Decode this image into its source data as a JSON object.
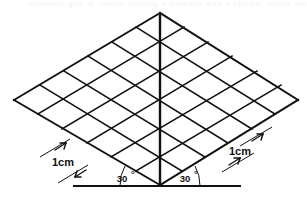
{
  "figure": {
    "name": "isometric-rhombus-grid",
    "description": "Isometric grid of rhombi forming a diamond with a vertical centre axis and a horizontal base line",
    "grid": {
      "cells_per_side": 6,
      "cell_label": "1cm",
      "apex": {
        "x": 160,
        "y": 13
      },
      "left_vertex": {
        "x": 14,
        "y": 100
      },
      "right_vertex": {
        "x": 298,
        "y": 100
      },
      "bottom_vertex": {
        "x": 160,
        "y": 185
      }
    },
    "axis": {
      "label": "centre-axis",
      "from": {
        "x": 160,
        "y": 13
      },
      "to": {
        "x": 160,
        "y": 185
      }
    },
    "baseline": {
      "label": "ground-line",
      "from": {
        "x": 73,
        "y": 186
      },
      "to": {
        "x": 241,
        "y": 186
      }
    },
    "angles": [
      {
        "id": "angle-left",
        "value": "30",
        "degree_symbol": "°",
        "x": 128,
        "y": 180
      },
      {
        "id": "angle-right",
        "value": "30",
        "degree_symbol": "°",
        "x": 183,
        "y": 180
      }
    ],
    "dimensions": [
      {
        "id": "dim-left",
        "text": "1cm",
        "x": 52,
        "y": 164
      },
      {
        "id": "dim-right",
        "text": "1cm",
        "x": 229,
        "y": 152
      }
    ],
    "colors": {
      "stroke": "#111111",
      "background": "#ffffff"
    }
  }
}
